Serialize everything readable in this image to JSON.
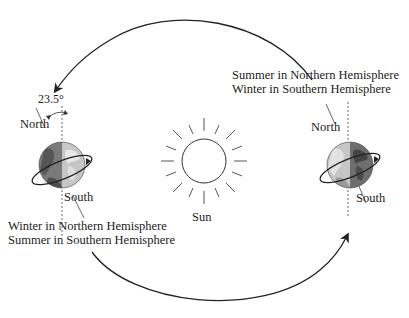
{
  "diagram": {
    "sun": {
      "label": "Sun"
    },
    "tilt_angle": "23.5°",
    "left_earth": {
      "north_label": "North",
      "south_label": "South",
      "caption_line1": "Winter in Northern Hemisphere",
      "caption_line2": "Summer in Southern Hemisphere"
    },
    "right_earth": {
      "north_label": "North",
      "south_label": "South",
      "caption_line1": "Summer in Northern Hemisphere",
      "caption_line2": "Winter in Southern Hemisphere"
    },
    "orbit_arrows": [
      {
        "name": "top-arc",
        "direction": "right-to-left"
      },
      {
        "name": "bottom-arc",
        "direction": "left-to-right"
      }
    ],
    "colors": {
      "line": "#222222",
      "globe_light": "#bdbdbd",
      "globe_dark": "#6e6e6e",
      "globe_land_dark": "#4a4a4a"
    }
  }
}
